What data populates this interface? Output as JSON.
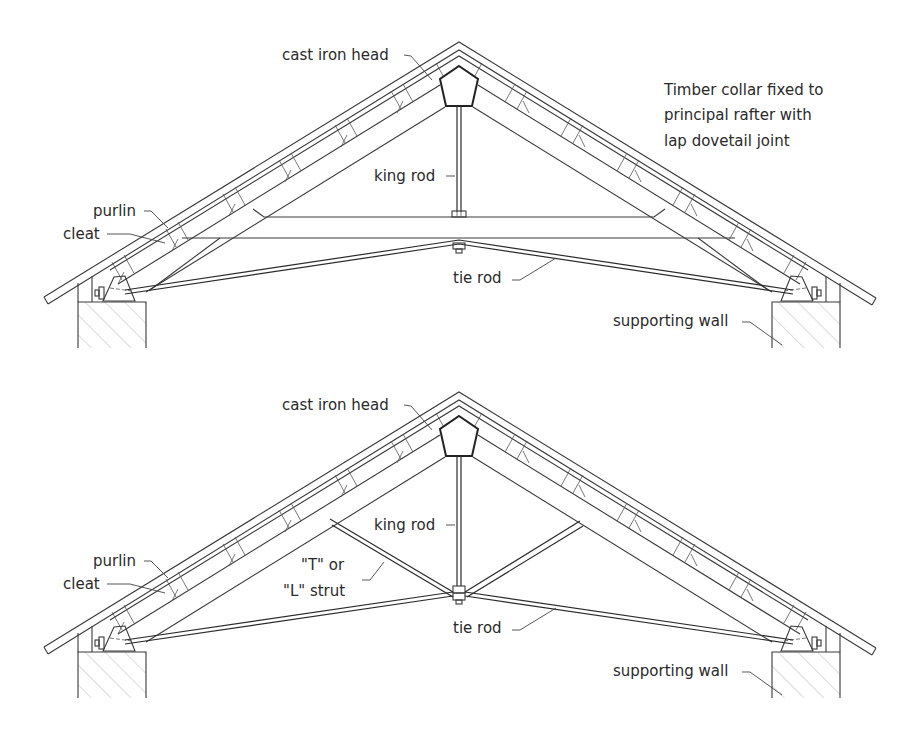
{
  "figure": {
    "type": "roof truss diagrams",
    "diagrams": [
      {
        "id": "top",
        "description": "King rod truss with timber collar",
        "labels": {
          "cast_iron_head": "cast iron head",
          "king_rod": "king rod",
          "purlin": "purlin",
          "cleat": "cleat",
          "tie_rod": "tie rod",
          "supporting_wall": "supporting wall",
          "note_line1": "Timber collar fixed to",
          "note_line2": "principal rafter with",
          "note_line3": "lap dovetail joint"
        }
      },
      {
        "id": "bottom",
        "description": "King rod truss with T or L struts",
        "labels": {
          "cast_iron_head": "cast iron head",
          "king_rod": "king rod",
          "purlin": "purlin",
          "cleat": "cleat",
          "strut_line1": "\"T\" or",
          "strut_line2": "\"L\" strut",
          "tie_rod": "tie rod",
          "supporting_wall": "supporting wall"
        }
      }
    ],
    "colors": {
      "line": "#3a3a3a",
      "background": "#ffffff",
      "hatch": "#9a9a9a"
    }
  }
}
